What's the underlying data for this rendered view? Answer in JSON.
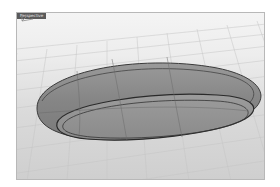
{
  "viewport": {
    "label": "Perspective",
    "background_top": "#f4f4f4",
    "background_bottom": "#cfcfcf",
    "grid_color": "#bdbdbd",
    "model": {
      "description": "rounded oval tray/ring surface",
      "fill_color": "#8c8c8c",
      "edge_color": "#333333"
    },
    "axis_labels": {
      "x": "x",
      "y": "y",
      "z": "z"
    }
  }
}
